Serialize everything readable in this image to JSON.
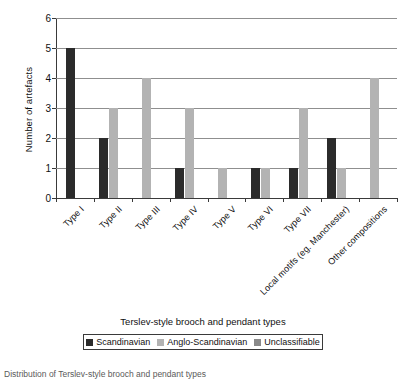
{
  "chart_data": {
    "type": "bar",
    "title": "",
    "xlabel": "Terslev-style brooch and pendant types",
    "ylabel": "Number of artefacts",
    "ylim": [
      0,
      6
    ],
    "yticks": [
      0,
      1,
      2,
      3,
      4,
      5,
      6
    ],
    "grid": true,
    "legend_position": "bottom",
    "categories": [
      "Type I",
      "Type II",
      "Type III",
      "Type IV",
      "Type V",
      "Type VI",
      "Type VII",
      "Local motifs (eg. Manchester)",
      "Other compositions"
    ],
    "series": [
      {
        "name": "Scandinavian",
        "color": "#2b2b2b",
        "values": [
          5,
          2,
          0,
          1,
          0,
          1,
          1,
          2,
          0
        ]
      },
      {
        "name": "Anglo-Scandinavian",
        "color": "#b3b3b3",
        "values": [
          0,
          3,
          4,
          3,
          1,
          1,
          3,
          1,
          4
        ]
      },
      {
        "name": "Unclassifiable",
        "color": "#8a8a8a",
        "values": [
          0,
          0,
          0,
          0,
          0,
          0,
          0,
          0,
          0
        ]
      }
    ]
  },
  "axes": {
    "y_title": "Number of artefacts",
    "x_title": "Terslev-style brooch and pendant types",
    "y_tick_labels": [
      "0",
      "1",
      "2",
      "3",
      "4",
      "5",
      "6"
    ],
    "x_tick_labels": [
      "Type I",
      "Type II",
      "Type III",
      "Type IV",
      "Type V",
      "Type VI",
      "Type VII",
      "Local motifs (eg. Manchester)",
      "Other compositions"
    ]
  },
  "legend": {
    "items": [
      {
        "label": "Scandinavian",
        "color": "#2b2b2b"
      },
      {
        "label": "Anglo-Scandinavian",
        "color": "#b3b3b3"
      },
      {
        "label": "Unclassifiable",
        "color": "#8a8a8a"
      }
    ]
  },
  "caption": {
    "text": "Distribution of Terslev-style brooch and pendant types"
  },
  "colors": {
    "axis": "#3a3a3a",
    "grid": "#8f8f8f",
    "background": "#ffffff",
    "text": "#111111"
  }
}
